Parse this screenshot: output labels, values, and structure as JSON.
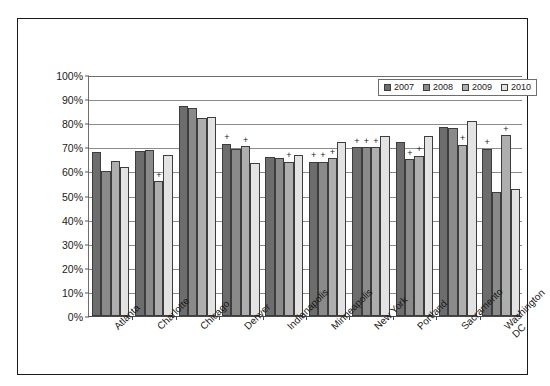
{
  "chart_data": {
    "type": "bar",
    "title": "",
    "subtitle": "",
    "xlabel": "",
    "ylabel": "",
    "ylim": [
      0,
      100
    ],
    "ytick_labels": [
      "0%",
      "10%",
      "20%",
      "30%",
      "40%",
      "50%",
      "60%",
      "70%",
      "80%",
      "90%",
      "100%"
    ],
    "ytick_values": [
      0,
      10,
      20,
      30,
      40,
      50,
      60,
      70,
      80,
      90,
      100
    ],
    "grid": "horizontal",
    "legend_position": "top-right",
    "categories": [
      "Atlanta",
      "Charlotte",
      "Chicago",
      "Denver",
      "Indianapolis",
      "Minneapolis",
      "New York",
      "Portland",
      "Sacramento",
      "Washington DC"
    ],
    "series": [
      {
        "name": "2007",
        "color": "#6d6d6d",
        "values": [
          68,
          68.5,
          87,
          71.5,
          66,
          64,
          70,
          72,
          78.5,
          69.5
        ]
      },
      {
        "name": "2008",
        "color": "#8a8a8a",
        "values": [
          60,
          69,
          86.5,
          69.5,
          65.5,
          64,
          70,
          65,
          78,
          51.5
        ]
      },
      {
        "name": "2009",
        "color": "#aeaeae",
        "values": [
          64.5,
          56,
          82,
          70.5,
          64,
          65.5,
          70,
          66.5,
          71,
          75
        ]
      },
      {
        "name": "2010",
        "color": "#e3e3e3",
        "values": [
          62,
          67,
          82.5,
          63.5,
          67,
          72,
          74.5,
          74.5,
          81,
          52.5
        ]
      }
    ],
    "annotations": {
      "symbol": "+",
      "marked": [
        {
          "category": "Charlotte",
          "series": "2009"
        },
        {
          "category": "Denver",
          "series": "2007"
        },
        {
          "category": "Denver",
          "series": "2009"
        },
        {
          "category": "Indianapolis",
          "series": "2009"
        },
        {
          "category": "Minneapolis",
          "series": "2007"
        },
        {
          "category": "Minneapolis",
          "series": "2008"
        },
        {
          "category": "Minneapolis",
          "series": "2009"
        },
        {
          "category": "New York",
          "series": "2007"
        },
        {
          "category": "New York",
          "series": "2008"
        },
        {
          "category": "New York",
          "series": "2009"
        },
        {
          "category": "Portland",
          "series": "2008"
        },
        {
          "category": "Portland",
          "series": "2009"
        },
        {
          "category": "Sacramento",
          "series": "2009"
        },
        {
          "category": "Washington DC",
          "series": "2007"
        },
        {
          "category": "Washington DC",
          "series": "2009"
        }
      ]
    },
    "x_label_lines": [
      [
        "Atlanta"
      ],
      [
        "Charlotte"
      ],
      [
        "Chicago"
      ],
      [
        "Denver"
      ],
      [
        "Indianapolis"
      ],
      [
        "Minneapolis"
      ],
      [
        "New York"
      ],
      [
        "Portland"
      ],
      [
        "Sacramento"
      ],
      [
        "Washington",
        "DC"
      ]
    ]
  },
  "legend": {
    "items": [
      {
        "label": "2007"
      },
      {
        "label": "2008"
      },
      {
        "label": "2009"
      },
      {
        "label": "2010"
      }
    ]
  },
  "colors": {
    "series_2007": "#6d6d6d",
    "series_2008": "#8a8a8a",
    "series_2009": "#aeaeae",
    "series_2010": "#e3e3e3",
    "frame": "#1a1a1a",
    "gridline": "#8c8c8c",
    "background": "#ffffff"
  }
}
